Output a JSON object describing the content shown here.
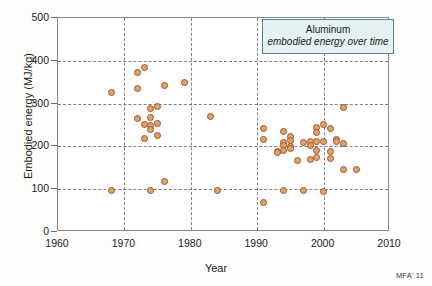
{
  "chart_data": {
    "type": "scatter",
    "title": "Aluminum",
    "subtitle": "embodied energy over time",
    "xlabel": "Year",
    "ylabel": "Embodied energy (MJ/kg)",
    "xlim": [
      1960,
      2010
    ],
    "ylim": [
      0,
      500
    ],
    "xticks": [
      1960,
      1970,
      1980,
      1990,
      2000,
      2010
    ],
    "yticks": [
      0,
      100,
      200,
      300,
      400,
      500
    ],
    "grid": true,
    "legend_position": "top-right",
    "watermark": "MFA' 11",
    "marker": {
      "fill": "#c9ae6a",
      "edge": "#c0452a",
      "shape": "circle"
    },
    "series": [
      {
        "name": "Aluminum embodied energy",
        "points": [
          [
            1968,
            327
          ],
          [
            1968,
            97
          ],
          [
            1972,
            373
          ],
          [
            1972,
            335
          ],
          [
            1972,
            266
          ],
          [
            1973,
            385
          ],
          [
            1973,
            252
          ],
          [
            1973,
            219
          ],
          [
            1974,
            288
          ],
          [
            1974,
            268
          ],
          [
            1974,
            248
          ],
          [
            1974,
            240
          ],
          [
            1974,
            96
          ],
          [
            1975,
            293
          ],
          [
            1975,
            254
          ],
          [
            1975,
            225
          ],
          [
            1976,
            342
          ],
          [
            1976,
            119
          ],
          [
            1979,
            350
          ],
          [
            1983,
            269
          ],
          [
            1984,
            97
          ],
          [
            1991,
            241
          ],
          [
            1991,
            216
          ],
          [
            1991,
            69
          ],
          [
            1993,
            188
          ],
          [
            1993,
            185
          ],
          [
            1994,
            235
          ],
          [
            1994,
            209
          ],
          [
            1994,
            203
          ],
          [
            1994,
            190
          ],
          [
            1994,
            97
          ],
          [
            1995,
            224
          ],
          [
            1995,
            213
          ],
          [
            1995,
            200
          ],
          [
            1995,
            196
          ],
          [
            1996,
            167
          ],
          [
            1997,
            209
          ],
          [
            1997,
            96
          ],
          [
            1998,
            212
          ],
          [
            1998,
            202
          ],
          [
            1998,
            169
          ],
          [
            1999,
            243
          ],
          [
            1999,
            232
          ],
          [
            1999,
            212
          ],
          [
            1999,
            190
          ],
          [
            1999,
            173
          ],
          [
            2000,
            252
          ],
          [
            2000,
            211
          ],
          [
            2000,
            94
          ],
          [
            2001,
            241
          ],
          [
            2001,
            188
          ],
          [
            2001,
            171
          ],
          [
            2002,
            216
          ],
          [
            2002,
            211
          ],
          [
            2003,
            292
          ],
          [
            2003,
            207
          ],
          [
            2003,
            145
          ],
          [
            2005,
            145
          ]
        ]
      }
    ]
  },
  "axes": {
    "x_title": "Year",
    "y_title": "Embodied energy (MJ/kg)",
    "x_ticks": [
      "1960",
      "1970",
      "1980",
      "1990",
      "2000",
      "2010"
    ],
    "y_ticks": [
      "0",
      "100",
      "200",
      "300",
      "400",
      "500"
    ]
  },
  "legend": {
    "line1": "Aluminum",
    "line2": "embodied energy over time"
  },
  "watermark": "MFA' 11"
}
